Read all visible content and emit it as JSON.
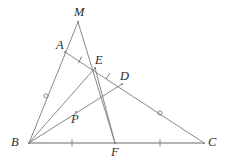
{
  "figure": {
    "background": "#ffffff",
    "stroke_color": "#7a7a7a",
    "baseline_color": "#9a9a9a",
    "label_color": "#2b2b2b",
    "width": 234,
    "height": 163
  },
  "points": [
    {
      "id": "M",
      "label": "M",
      "x": 78,
      "y": 22,
      "label_x": 74,
      "label_y": 6
    },
    {
      "id": "A",
      "label": "A",
      "x": 65,
      "y": 52,
      "label_x": 56,
      "label_y": 39
    },
    {
      "id": "E",
      "label": "E",
      "x": 95,
      "y": 68,
      "label_x": 95,
      "label_y": 54
    },
    {
      "id": "D",
      "label": "D",
      "x": 122,
      "y": 84,
      "label_x": 120,
      "label_y": 70
    },
    {
      "id": "P",
      "label": "P",
      "x": 76,
      "y": 112,
      "label_x": 71,
      "label_y": 113
    },
    {
      "id": "B",
      "label": "B",
      "x": 29,
      "y": 143,
      "label_x": 11,
      "label_y": 136
    },
    {
      "id": "F",
      "label": "F",
      "x": 115,
      "y": 143,
      "label_x": 111,
      "label_y": 146
    },
    {
      "id": "C",
      "label": "C",
      "x": 204,
      "y": 143,
      "label_x": 208,
      "label_y": 136
    }
  ],
  "segments": [
    {
      "name": "segment-MB",
      "from": "M",
      "to": "B",
      "style": "normal"
    },
    {
      "name": "segment-MF",
      "from": "M",
      "to": "F",
      "style": "normal"
    },
    {
      "name": "segment-AC",
      "from": "A",
      "to": "C",
      "style": "normal"
    },
    {
      "name": "segment-BE",
      "from": "B",
      "to": "E",
      "style": "normal"
    },
    {
      "name": "segment-BD",
      "from": "B",
      "to": "D",
      "style": "normal"
    },
    {
      "name": "segment-EF",
      "from": "E",
      "to": "F",
      "style": "normal"
    },
    {
      "name": "segment-BC",
      "from": "B",
      "to": "C",
      "style": "baseline"
    }
  ],
  "tick_marks": [
    {
      "name": "tick-AE",
      "on": "segment-AE",
      "x": 80,
      "y": 60,
      "angle": 28
    },
    {
      "name": "tick-ED",
      "on": "segment-ED",
      "x": 108,
      "y": 76,
      "angle": 30
    },
    {
      "name": "tick-BF",
      "on": "segment-BF",
      "x": 72,
      "y": 143,
      "angle": 0
    },
    {
      "name": "tick-FC",
      "on": "segment-FC",
      "x": 160,
      "y": 143,
      "angle": 0
    }
  ],
  "circle_marks": [
    {
      "name": "circle-mark-AB",
      "on": "segment-AB",
      "x": 46,
      "y": 96,
      "r": 2.1
    },
    {
      "name": "circle-mark-DC",
      "on": "segment-DC",
      "x": 160,
      "y": 113,
      "r": 2.1
    }
  ],
  "relations": {
    "equal_lengths_tick": "AE = ED and BF = FC",
    "equal_lengths_circle": "AB and DC marked with circles"
  }
}
